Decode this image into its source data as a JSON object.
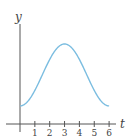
{
  "chart_data": {
    "type": "line",
    "title": "",
    "xlabel": "t",
    "ylabel": "y",
    "xlim": [
      0,
      6.5
    ],
    "ylim": [
      0,
      5.6
    ],
    "x_ticks": [
      1,
      2,
      3,
      4,
      5,
      6
    ],
    "x_tick_labels": [
      "1",
      "2",
      "3",
      "4",
      "5",
      "6"
    ],
    "y_ticks": [],
    "grid": false,
    "legend": "none",
    "series": [
      {
        "name": "y(t)",
        "color": "#7bbde0",
        "x": [
          0,
          0.5,
          1,
          1.5,
          2,
          2.5,
          3,
          3.5,
          4,
          4.5,
          5,
          5.5,
          6
        ],
        "y": [
          1.2,
          1.47,
          2.23,
          3.25,
          4.27,
          5.03,
          5.3,
          5.03,
          4.27,
          3.25,
          2.23,
          1.47,
          1.2
        ]
      }
    ]
  }
}
